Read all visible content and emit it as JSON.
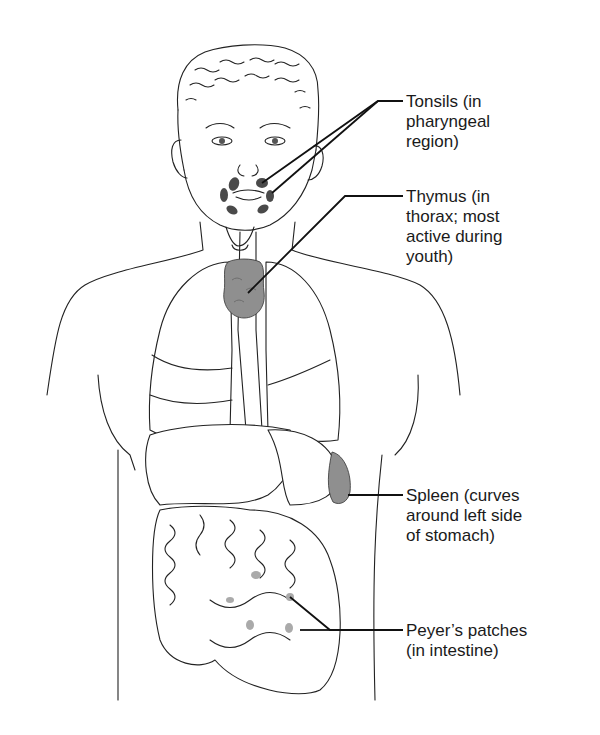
{
  "figure": {
    "type": "anatomical diagram",
    "colors": {
      "line": "#222222",
      "organ_highlight": "#8f8f8f",
      "tonsil_spots": "#4a4a4a",
      "background": "#ffffff"
    }
  },
  "labels": [
    {
      "id": "tonsils",
      "text": "Tonsils (in\npharyngeal\nregion)"
    },
    {
      "id": "thymus",
      "text": "Thymus (in\nthorax; most\nactive during\nyouth)"
    },
    {
      "id": "spleen",
      "text": "Spleen (curves\naround left side\nof stomach)"
    },
    {
      "id": "peyers",
      "text": "Peyer’s patches\n(in intestine)"
    }
  ]
}
